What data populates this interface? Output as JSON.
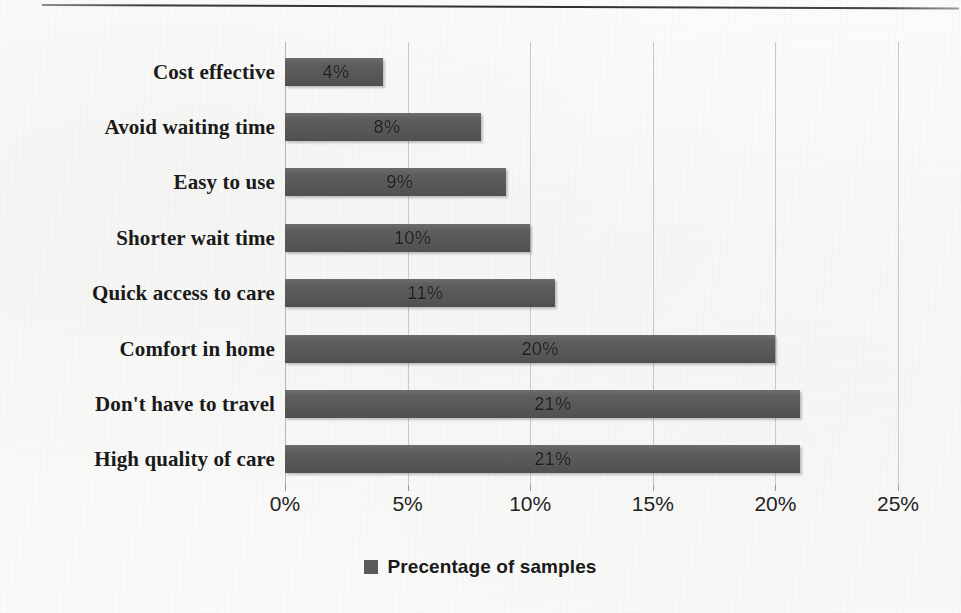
{
  "chart_data": {
    "type": "bar",
    "orientation": "horizontal",
    "title": "",
    "xlabel": "",
    "ylabel": "",
    "xlim": [
      0,
      25
    ],
    "grid": true,
    "legend_position": "bottom",
    "legend": [
      "Precentage of samples"
    ],
    "categories": [
      "Cost effective",
      "Avoid waiting time",
      "Easy to use",
      "Shorter wait time",
      "Quick access to care",
      "Comfort in home",
      "Don't have to travel",
      "High quality of care"
    ],
    "values": [
      4,
      8,
      9,
      10,
      11,
      20,
      21,
      21
    ],
    "data_labels": [
      "4%",
      "8%",
      "9%",
      "10%",
      "11%",
      "20%",
      "21%",
      "21%"
    ],
    "xticks": [
      0,
      5,
      10,
      15,
      20,
      25
    ],
    "xtick_labels": [
      "0%",
      "5%",
      "10%",
      "15%",
      "20%",
      "25%"
    ],
    "series": [
      {
        "name": "Precentage of samples",
        "values": [
          4,
          8,
          9,
          10,
          11,
          20,
          21,
          21
        ]
      }
    ],
    "colors": {
      "bar": "#595959",
      "gridline": "#c9c9c9",
      "axis": "#b4b4b4",
      "text": "#1a1a1a",
      "background": "#fbfbf9"
    }
  },
  "legend": {
    "label": "Precentage of samples",
    "swatch_color": "#595959"
  }
}
